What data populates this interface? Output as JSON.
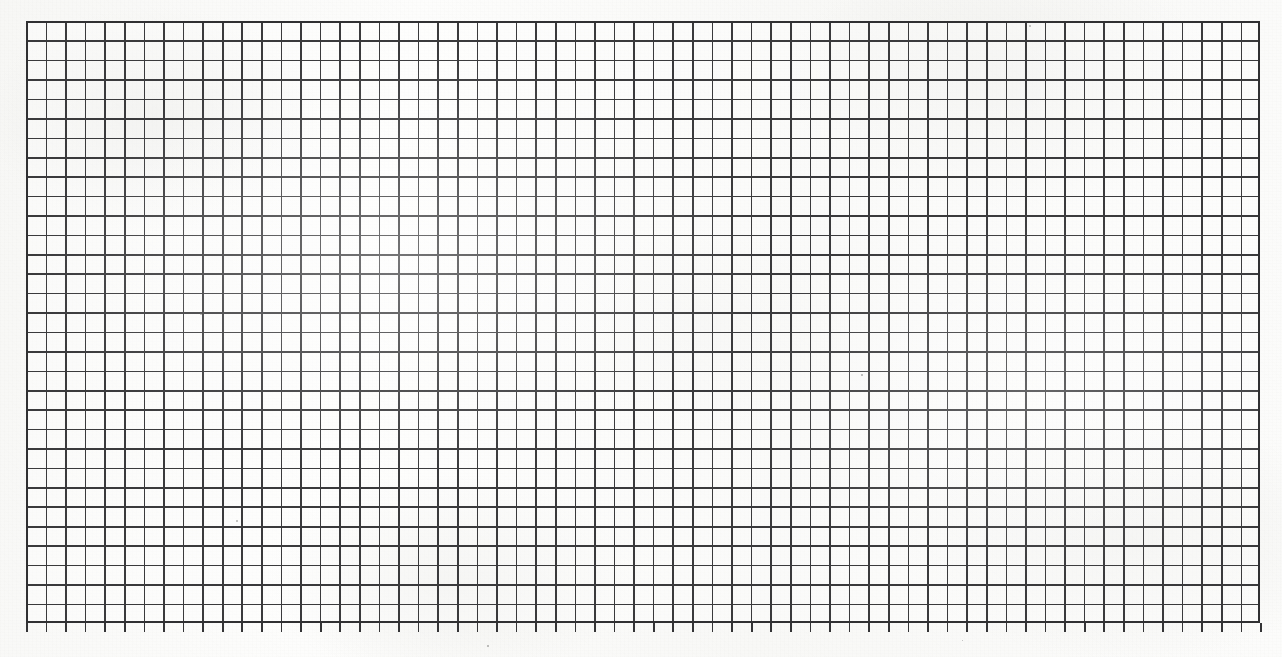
{
  "document": {
    "kind": "graph-paper-scan",
    "title": "Blank graph paper sheet (scanned)",
    "page_width_px": 1282,
    "page_height_px": 657,
    "paper_color": "#fbfbfa",
    "ink_color": "#3a3a3c"
  },
  "grid": {
    "origin_x_px": 26,
    "origin_y_px": 21,
    "width_px": 1234,
    "height_px": 602,
    "cell_width_px": 19.59,
    "cell_height_px": 19.42,
    "columns": 63,
    "rows": 31,
    "line_width_px": 1.6,
    "line_color": "#3a3a3c",
    "frame_color": "#303032",
    "frame_width_px": 2,
    "has_major_lines": false,
    "label_text": ""
  },
  "ticks": {
    "name": "bottom-axis-ticks",
    "count": 64,
    "spacing_px": 19.59,
    "start_x_px": 0,
    "top_y_px": 623,
    "length_px": 9,
    "color": "#343436"
  },
  "annotations": {
    "text_items": [],
    "note": ""
  },
  "artifacts": {
    "specks": [
      {
        "x": 1029,
        "y": 25,
        "size": 2.0
      },
      {
        "x": 236,
        "y": 520,
        "size": 1.8
      },
      {
        "x": 861,
        "y": 374,
        "size": 1.6
      },
      {
        "x": 200,
        "y": 313,
        "size": 1.5
      },
      {
        "x": 1240,
        "y": 352,
        "size": 1.4
      },
      {
        "x": 487,
        "y": 645,
        "size": 1.5
      },
      {
        "x": 962,
        "y": 640,
        "size": 1.4
      }
    ]
  }
}
